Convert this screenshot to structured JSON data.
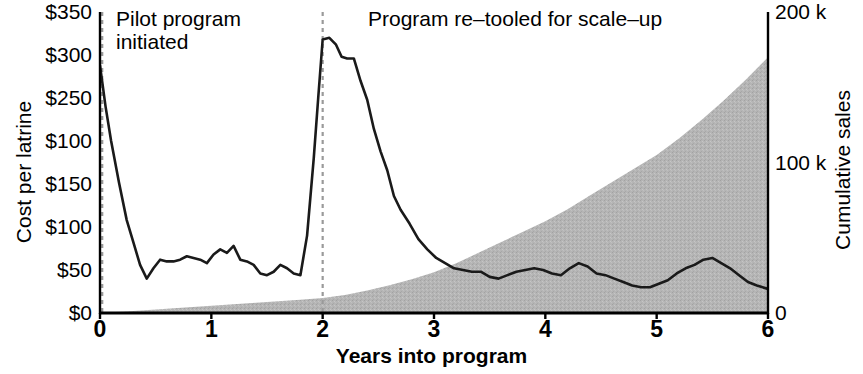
{
  "chart_data": {
    "type": "line",
    "title": "",
    "xlabel": "Years into program",
    "ylabel": "Cost per latrine",
    "y2label": "Cumulative sales",
    "xlim": [
      0,
      6
    ],
    "xticks": [
      "0",
      "1",
      "2",
      "3",
      "4",
      "5",
      "6"
    ],
    "xtick_values": [
      0,
      1,
      2,
      3,
      4,
      5,
      6
    ],
    "ylim": [
      0,
      350
    ],
    "yticks": [
      "$0",
      "$50",
      "$100",
      "$150",
      "$100",
      "$250",
      "$300",
      "$350"
    ],
    "ytick_values": [
      0,
      50,
      100,
      150,
      200,
      250,
      300,
      350
    ],
    "y2lim": [
      0,
      200000
    ],
    "y2ticks": [
      "0",
      "100 k",
      "200 k"
    ],
    "y2tick_values": [
      0,
      100000,
      200000
    ],
    "grid": false,
    "legend": "none",
    "annotations": [
      {
        "text": "Pilot program\ninitiated",
        "x": 0.06,
        "line_x": 0.02,
        "style": "dashed-vline"
      },
      {
        "text": "Program re–tooled for scale–up",
        "x": 2.07,
        "line_x": 2.0,
        "style": "dashed-vline"
      }
    ],
    "series": [
      {
        "name": "Cost per latrine",
        "axis": "left",
        "style": "line",
        "color": "#1a1a1a",
        "x": [
          0.0,
          0.05,
          0.1,
          0.17,
          0.24,
          0.3,
          0.36,
          0.42,
          0.48,
          0.54,
          0.6,
          0.66,
          0.72,
          0.78,
          0.84,
          0.9,
          0.96,
          1.02,
          1.08,
          1.14,
          1.2,
          1.26,
          1.32,
          1.38,
          1.44,
          1.5,
          1.56,
          1.62,
          1.68,
          1.74,
          1.8,
          1.86,
          1.92,
          1.96,
          2.0,
          2.06,
          2.12,
          2.17,
          2.22,
          2.28,
          2.34,
          2.4,
          2.46,
          2.52,
          2.58,
          2.64,
          2.7,
          2.78,
          2.86,
          2.94,
          3.02,
          3.1,
          3.18,
          3.26,
          3.34,
          3.42,
          3.5,
          3.58,
          3.66,
          3.74,
          3.82,
          3.9,
          3.98,
          4.06,
          4.14,
          4.22,
          4.3,
          4.38,
          4.46,
          4.54,
          4.62,
          4.7,
          4.78,
          4.86,
          4.94,
          5.02,
          5.1,
          5.18,
          5.26,
          5.34,
          5.42,
          5.5,
          5.58,
          5.66,
          5.74,
          5.82,
          5.9,
          6.0
        ],
        "y": [
          288,
          240,
          200,
          152,
          108,
          82,
          56,
          40,
          52,
          62,
          60,
          60,
          62,
          66,
          64,
          62,
          58,
          68,
          74,
          70,
          78,
          62,
          60,
          56,
          46,
          44,
          48,
          56,
          52,
          46,
          44,
          90,
          180,
          250,
          318,
          320,
          312,
          298,
          296,
          296,
          270,
          248,
          214,
          188,
          166,
          136,
          120,
          104,
          86,
          74,
          64,
          58,
          52,
          50,
          48,
          48,
          42,
          40,
          44,
          48,
          50,
          52,
          50,
          46,
          44,
          52,
          58,
          54,
          46,
          44,
          40,
          36,
          32,
          30,
          30,
          34,
          38,
          46,
          52,
          56,
          62,
          64,
          58,
          52,
          44,
          36,
          32,
          28
        ]
      },
      {
        "name": "Cumulative sales",
        "axis": "right",
        "style": "area",
        "color": "#b3b3b3",
        "x": [
          0.0,
          0.2,
          0.4,
          0.6,
          0.8,
          1.0,
          1.2,
          1.4,
          1.6,
          1.8,
          2.0,
          2.2,
          2.4,
          2.6,
          2.8,
          3.0,
          3.2,
          3.4,
          3.6,
          3.8,
          4.0,
          4.2,
          4.4,
          4.6,
          4.8,
          5.0,
          5.2,
          5.4,
          5.6,
          5.8,
          6.0
        ],
        "y": [
          300,
          900,
          1800,
          2800,
          3800,
          4800,
          5800,
          6800,
          7800,
          8800,
          10000,
          12000,
          15000,
          18500,
          22500,
          27000,
          33000,
          40000,
          47000,
          54000,
          61000,
          69000,
          78000,
          87000,
          96000,
          105000,
          116000,
          128000,
          141000,
          155000,
          170000
        ]
      }
    ]
  },
  "axes": {
    "left_title": "Cost per latrine",
    "right_title": "Cumulative sales",
    "bottom_title": "Years into program"
  },
  "colors": {
    "line": "#1a1a1a",
    "area": "#b3b3b3",
    "axis": "#000000",
    "annotation_line": "#9a9a9a",
    "background": "#ffffff"
  }
}
